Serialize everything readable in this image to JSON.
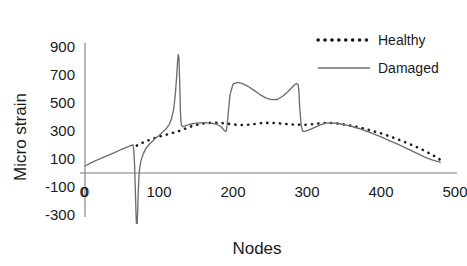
{
  "chart_data": {
    "type": "line",
    "title": "",
    "xlabel": "Nodes",
    "ylabel": "Micro strain",
    "xlim": [
      0,
      500
    ],
    "ylim": [
      -300,
      900
    ],
    "xticks": [
      0,
      100,
      200,
      300,
      400,
      500
    ],
    "xtick_labels": [
      "0",
      "100",
      "200",
      "300",
      "400",
      "500"
    ],
    "yticks": [
      -300,
      -100,
      100,
      300,
      500,
      700,
      900
    ],
    "ytick_labels": [
      "-300",
      "-100",
      "100",
      "300",
      "500",
      "700",
      "900"
    ],
    "grid": false,
    "legend_position": "top-right",
    "origin_label": "0",
    "series": [
      {
        "name": "Healthy",
        "style": "dotted",
        "color": "#1d1d1d",
        "x": [
          70,
          76,
          82,
          88,
          94,
          100,
          106,
          112,
          118,
          124,
          130,
          136,
          142,
          148,
          154,
          160,
          166,
          172,
          178,
          184,
          190,
          196,
          202,
          208,
          214,
          220,
          226,
          232,
          238,
          244,
          250,
          256,
          262,
          268,
          274,
          280,
          286,
          292,
          298,
          304,
          310,
          316,
          322,
          328,
          334,
          340,
          346,
          352,
          358,
          364,
          370,
          376,
          382,
          388,
          394,
          400,
          410,
          420,
          430,
          440,
          450,
          460,
          470,
          480
        ],
        "y": [
          196,
          212,
          226,
          238,
          249,
          259,
          268,
          277,
          286,
          295,
          304,
          318,
          330,
          340,
          348,
          354,
          357,
          359,
          359,
          357,
          354,
          350,
          346,
          343,
          342,
          344,
          348,
          352,
          356,
          358,
          358,
          357,
          355,
          352,
          349,
          347,
          345,
          344,
          345,
          347,
          350,
          354,
          357,
          358,
          357,
          354,
          350,
          345,
          339,
          333,
          326,
          318,
          310,
          301,
          292,
          283,
          265,
          246,
          226,
          204,
          181,
          156,
          128,
          95
        ]
      },
      {
        "name": "Damaged",
        "style": "solid",
        "color": "#6e6e6e",
        "x": [
          0,
          8,
          16,
          24,
          32,
          40,
          48,
          55,
          60,
          63,
          65,
          66,
          67,
          68,
          69,
          70,
          71,
          72,
          73,
          74,
          76,
          79,
          82,
          86,
          90,
          95,
          100,
          105,
          110,
          114,
          117,
          120,
          122,
          124,
          125,
          126,
          127,
          128,
          129,
          130,
          132,
          136,
          142,
          148,
          154,
          160,
          166,
          172,
          178,
          184,
          188,
          190,
          191,
          192,
          194,
          196,
          200,
          206,
          212,
          220,
          228,
          236,
          244,
          252,
          260,
          268,
          274,
          280,
          284,
          286,
          288,
          289,
          290,
          292,
          294,
          296,
          300,
          306,
          312,
          318,
          324,
          330,
          336,
          344,
          352,
          360,
          370,
          380,
          390,
          400,
          412,
          424,
          436,
          448,
          460,
          470,
          480
        ],
        "y": [
          50,
          72,
          92,
          110,
          128,
          146,
          166,
          182,
          192,
          198,
          200,
          160,
          60,
          -120,
          -300,
          -420,
          -300,
          -130,
          -20,
          40,
          95,
          140,
          172,
          200,
          222,
          246,
          268,
          292,
          318,
          348,
          390,
          460,
          560,
          700,
          790,
          845,
          820,
          640,
          430,
          345,
          330,
          338,
          348,
          355,
          358,
          359,
          358,
          354,
          348,
          330,
          305,
          296,
          300,
          340,
          450,
          560,
          635,
          648,
          640,
          620,
          592,
          562,
          537,
          524,
          525,
          552,
          580,
          612,
          634,
          640,
          630,
          590,
          480,
          345,
          300,
          296,
          302,
          316,
          330,
          344,
          354,
          358,
          357,
          352,
          344,
          334,
          318,
          300,
          280,
          258,
          230,
          202,
          172,
          142,
          112,
          92,
          78
        ]
      }
    ],
    "legend": [
      {
        "label": "Healthy",
        "style": "dotted"
      },
      {
        "label": "Damaged",
        "style": "solid"
      }
    ]
  }
}
